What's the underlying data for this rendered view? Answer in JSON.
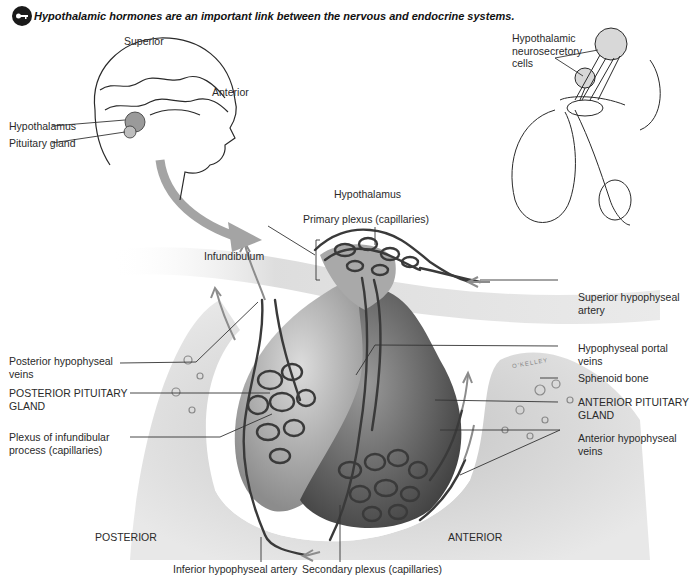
{
  "caption": {
    "icon": "key-icon",
    "text": "Hypothalamic hormones are an important link between the nervous and endocrine systems."
  },
  "head_view": {
    "orientation_labels": {
      "superior": "Superior",
      "anterior": "Anterior"
    },
    "labels": {
      "hypothalamus": "Hypothalamus",
      "pituitary": "Pituitary gland"
    }
  },
  "inset": {
    "label_line1": "Hypothalamic",
    "label_line2": "neurosecretory",
    "label_line3": "cells"
  },
  "main": {
    "top_labels": {
      "hypothalamus": "Hypothalamus",
      "primary_plexus": "Primary plexus (capillaries)",
      "infundibulum": "Infundibulum"
    },
    "left_labels": [
      {
        "line1": "Posterior hypophyseal",
        "line2": "veins"
      },
      {
        "line1": "POSTERIOR PITUITARY",
        "line2": "GLAND"
      },
      {
        "line1": "Plexus of infundibular",
        "line2": "process (capillaries)"
      }
    ],
    "right_labels": [
      {
        "line1": "Superior hypophyseal",
        "line2": "artery"
      },
      {
        "line1": "Hypophyseal portal",
        "line2": "veins"
      },
      {
        "line1": "Sphenoid bone",
        "line2": ""
      },
      {
        "line1": "ANTERIOR PITUITARY",
        "line2": "GLAND"
      },
      {
        "line1": "Anterior hypophyseal",
        "line2": "veins"
      }
    ],
    "bottom_labels": {
      "posterior": "POSTERIOR",
      "anterior": "ANTERIOR",
      "inferior_artery": "Inferior hypophyseal artery",
      "secondary_plexus": "Secondary plexus (capillaries)"
    },
    "signature": "O'KELLEY"
  },
  "colors": {
    "bone": "#b8b8b8",
    "gland_light": "#c9c9c9",
    "gland_dark": "#5a5a5a",
    "vessel": "#3a3a3a",
    "arrow": "#9a9a9a"
  }
}
